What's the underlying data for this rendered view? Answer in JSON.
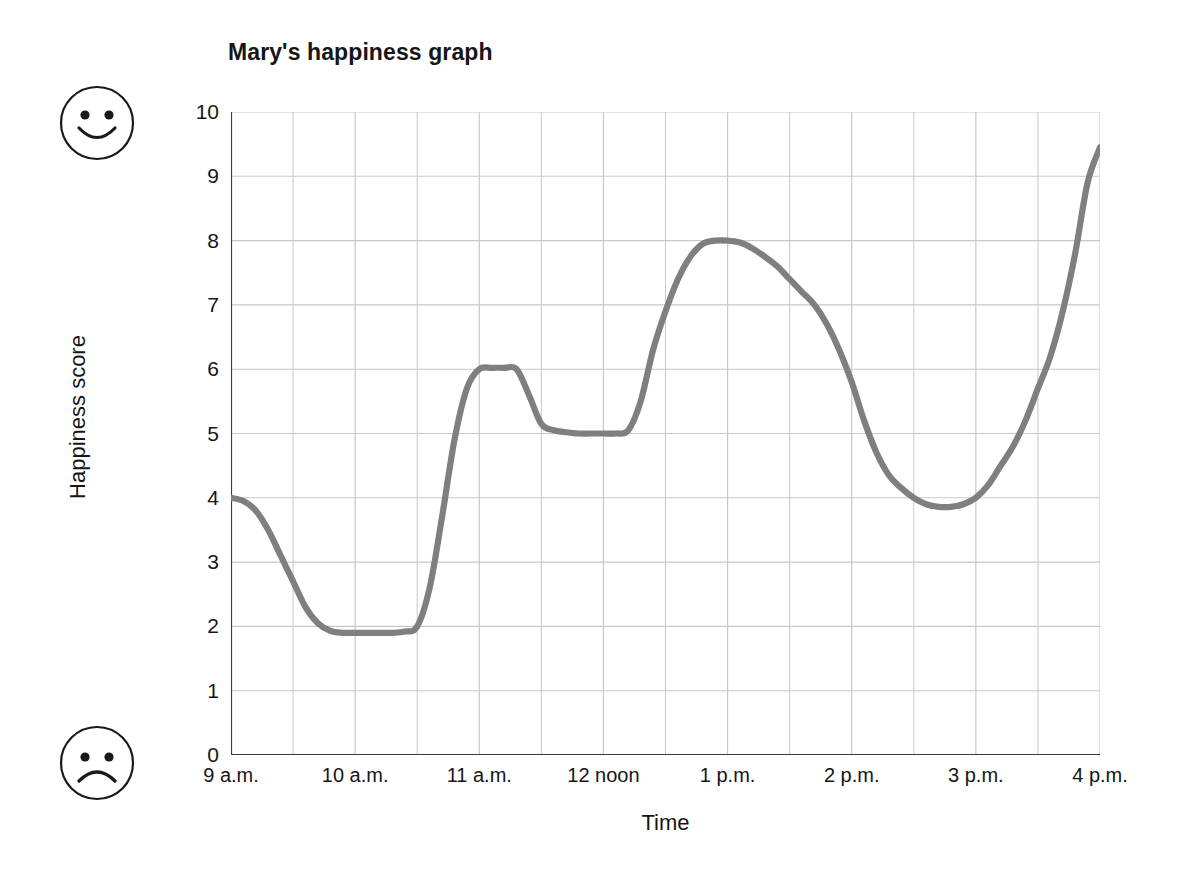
{
  "chart_data": {
    "type": "line",
    "title": "Mary's happiness graph",
    "xlabel": "Time",
    "ylabel": "Happiness score",
    "grid": true,
    "legend": false,
    "line_color": "#7f7f7f",
    "grid_color": "#c8c8c8",
    "axis_color": "#3a3a3a",
    "ylim": [
      0,
      10
    ],
    "yticks": [
      10,
      9,
      8,
      7,
      6,
      5,
      4,
      3,
      2,
      1,
      0
    ],
    "xlim": [
      "9 a.m.",
      "4 p.m."
    ],
    "xticks": [
      "9 a.m.",
      "10 a.m.",
      "11 a.m.",
      "12 noon",
      "1 p.m.",
      "2 p.m.",
      "3 p.m.",
      "4 p.m."
    ],
    "x_hours": [
      9,
      10,
      11,
      12,
      13,
      14,
      15,
      16
    ],
    "minor_gridline_interval_hours": 0.5,
    "annotations": [
      {
        "name": "happy-face",
        "position": "top-left",
        "meaning": "high happiness score"
      },
      {
        "name": "sad-face",
        "position": "bottom-left",
        "meaning": "low happiness score"
      }
    ],
    "x": [
      9,
      9.1,
      9.2,
      9.3,
      9.4,
      9.5,
      9.6,
      9.7,
      9.8,
      9.9,
      10,
      10.1,
      10.2,
      10.3,
      10.4,
      10.5,
      10.6,
      10.7,
      10.8,
      10.9,
      11,
      11.1,
      11.2,
      11.3,
      11.4,
      11.5,
      11.6,
      11.7,
      11.8,
      11.9,
      12,
      12.1,
      12.2,
      12.3,
      12.4,
      12.5,
      12.6,
      12.7,
      12.8,
      12.9,
      13,
      13.1,
      13.2,
      13.3,
      13.4,
      13.5,
      13.6,
      13.7,
      13.8,
      13.9,
      14,
      14.1,
      14.2,
      14.3,
      14.4,
      14.5,
      14.6,
      14.7,
      14.8,
      14.9,
      15,
      15.1,
      15.2,
      15.3,
      15.4,
      15.5,
      15.6,
      15.7,
      15.8,
      15.9,
      16
    ],
    "values": [
      4.0,
      3.95,
      3.8,
      3.5,
      3.1,
      2.7,
      2.3,
      2.05,
      1.93,
      1.9,
      1.9,
      1.9,
      1.9,
      1.9,
      1.92,
      2.0,
      2.6,
      3.7,
      4.9,
      5.7,
      6.0,
      6.02,
      6.02,
      6.0,
      5.6,
      5.15,
      5.05,
      5.02,
      5.0,
      5.0,
      5.0,
      5.0,
      5.05,
      5.5,
      6.3,
      6.9,
      7.4,
      7.75,
      7.95,
      8.0,
      8.0,
      7.97,
      7.88,
      7.75,
      7.6,
      7.4,
      7.2,
      7.0,
      6.7,
      6.3,
      5.8,
      5.2,
      4.7,
      4.35,
      4.15,
      4.0,
      3.9,
      3.86,
      3.86,
      3.9,
      4.0,
      4.2,
      4.5,
      4.8,
      5.2,
      5.7,
      6.2,
      6.9,
      7.8,
      8.9,
      9.45
    ],
    "key_points": [
      {
        "time": "9 a.m.",
        "score": 4
      },
      {
        "time": "9:50 a.m. - 10:20 a.m.",
        "score": 1.9,
        "note": "minimum plateau"
      },
      {
        "time": "11 a.m.",
        "score": 6,
        "note": "plateau"
      },
      {
        "time": "11:30 a.m. - 12:10 p.m.",
        "score": 5,
        "note": "plateau"
      },
      {
        "time": "12:50 p.m. - 1 p.m.",
        "score": 8,
        "note": "maximum plateau"
      },
      {
        "time": "2:40 p.m.",
        "score": 3.85,
        "note": "afternoon minimum"
      },
      {
        "time": "4 p.m.",
        "score": 9.45,
        "note": "final value"
      }
    ]
  }
}
